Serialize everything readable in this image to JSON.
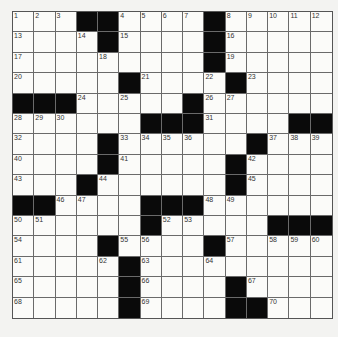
{
  "puzzle": {
    "size": {
      "rows": 15,
      "cols": 15
    },
    "colors": {
      "block": "#0a0a0a",
      "cell": "#fbfbf9",
      "line": "#6a6a6a",
      "background": "#f3f3f1"
    },
    "legend": "# = black square, . = empty white square, number = numbered white square",
    "rows": [
      [
        "1",
        "2",
        "3",
        "#",
        "#",
        "4",
        "5",
        "6",
        "7",
        "#",
        "8",
        "9",
        "10",
        "11",
        "12"
      ],
      [
        "13",
        ".",
        ".",
        "14",
        "#",
        "15",
        ".",
        ".",
        ".",
        "#",
        "16",
        ".",
        ".",
        ".",
        "."
      ],
      [
        "17",
        ".",
        ".",
        ".",
        "18",
        ".",
        ".",
        ".",
        ".",
        "#",
        "19",
        ".",
        ".",
        ".",
        "."
      ],
      [
        "20",
        ".",
        ".",
        ".",
        ".",
        "#",
        "21",
        ".",
        ".",
        "22",
        "#",
        "23",
        ".",
        ".",
        "."
      ],
      [
        "#",
        "#",
        "#",
        "24",
        ".",
        "25",
        ".",
        ".",
        "#",
        "26",
        "27",
        ".",
        ".",
        ".",
        "."
      ],
      [
        "28",
        "29",
        "30",
        ".",
        ".",
        ".",
        "#",
        "#",
        "#",
        "31",
        ".",
        ".",
        ".",
        "#",
        "#"
      ],
      [
        "32",
        ".",
        ".",
        ".",
        "#",
        "33",
        "34",
        "35",
        "36",
        ".",
        ".",
        "#",
        "37",
        "38",
        "39"
      ],
      [
        "40",
        ".",
        ".",
        ".",
        "#",
        "41",
        ".",
        ".",
        ".",
        ".",
        "#",
        "42",
        ".",
        ".",
        "."
      ],
      [
        "43",
        ".",
        ".",
        "#",
        "44",
        ".",
        ".",
        ".",
        ".",
        ".",
        "#",
        "45",
        ".",
        ".",
        "."
      ],
      [
        "#",
        "#",
        "46",
        "47",
        ".",
        ".",
        "#",
        "#",
        "#",
        "48",
        "49",
        ".",
        ".",
        ".",
        "."
      ],
      [
        "50",
        "51",
        ".",
        ".",
        ".",
        ".",
        "#",
        "52",
        "53",
        ".",
        ".",
        ".",
        "#",
        "#",
        "#"
      ],
      [
        "54",
        ".",
        ".",
        ".",
        "#",
        "55",
        "56",
        ".",
        ".",
        "#",
        "57",
        ".",
        "58",
        "59",
        "60"
      ],
      [
        "61",
        ".",
        ".",
        ".",
        "62",
        "#",
        "63",
        ".",
        ".",
        "64",
        ".",
        ".",
        ".",
        ".",
        "."
      ],
      [
        "65",
        ".",
        ".",
        ".",
        ".",
        "#",
        "66",
        ".",
        ".",
        ".",
        "#",
        "67",
        ".",
        ".",
        "."
      ],
      [
        "68",
        ".",
        ".",
        ".",
        ".",
        "#",
        "69",
        ".",
        ".",
        ".",
        "#",
        "#",
        "70",
        ".",
        "."
      ]
    ]
  }
}
